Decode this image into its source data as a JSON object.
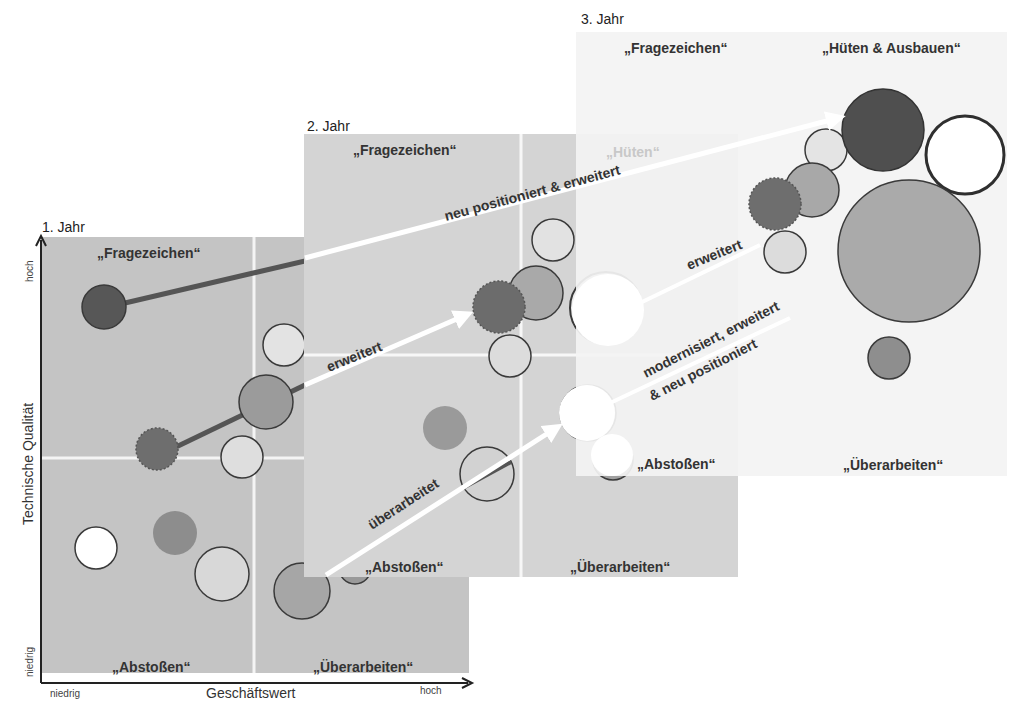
{
  "diagram": {
    "axes": {
      "x_label": "Geschäftswert",
      "y_label": "Technische Qualität",
      "x_low": "niedrig",
      "x_high": "hoch",
      "y_low": "niedrig",
      "y_high": "hoch"
    },
    "panels": [
      {
        "title": "1. Jahr",
        "quadrants": {
          "top_left": "„Fragezeichen“",
          "top_right": "„Hüten“",
          "bottom_left": "„Abstoßen“",
          "bottom_right": "„Überarbeiten“"
        }
      },
      {
        "title": "2. Jahr",
        "quadrants": {
          "top_left": "„Fragezeichen“",
          "top_right": "„Hüten“",
          "bottom_left": "„Abstoßen“",
          "bottom_right": "„Überarbeiten“"
        }
      },
      {
        "title": "3. Jahr",
        "quadrants": {
          "top_left": "„Fragezeichen“",
          "top_right": "„Hüten & Ausbauen“",
          "bottom_left": "„Abstoßen“",
          "bottom_right": "„Überarbeiten“"
        }
      }
    ],
    "transitions": [
      {
        "label": "neu positioniert & erweitert",
        "from": "1. Jahr",
        "to": "3. Jahr"
      },
      {
        "label": "erweitert",
        "from": "1. Jahr",
        "to": "2. Jahr"
      },
      {
        "label": "überarbeitet",
        "from": "1. Jahr",
        "to": "2. Jahr"
      },
      {
        "label": "erweitert",
        "from": "2. Jahr",
        "to": "3. Jahr"
      },
      {
        "label": "modernisiert, erweitert",
        "label_line2": "& neu positioniert",
        "from": "2. Jahr",
        "to": "3. Jahr"
      }
    ],
    "colors": {
      "panel1_bg": "#c4c4c4",
      "panel2_bg": "#d4d4d4",
      "panel3_bg": "#f3f3f3",
      "bubble_dark": "#555555",
      "bubble_mid": "#8f8f8f",
      "bubble_gray": "#a9a9a9",
      "bubble_light": "#e0e0e0",
      "bubble_white": "#ffffff",
      "arrow": "#ffffff",
      "connector": "#555555"
    }
  }
}
